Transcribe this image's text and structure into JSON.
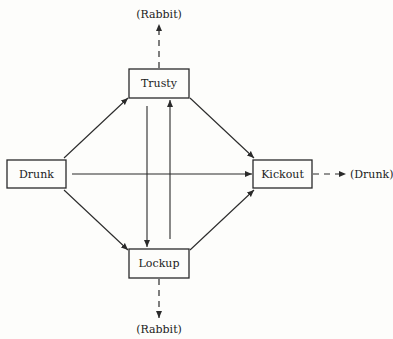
{
  "diagram": {
    "type": "state-transition",
    "nodes": [
      {
        "id": "trusty",
        "label": "Trusty"
      },
      {
        "id": "drunk",
        "label": "Drunk"
      },
      {
        "id": "kickout",
        "label": "Kickout"
      },
      {
        "id": "lockup",
        "label": "Lockup"
      }
    ],
    "external_labels": {
      "top": "(Rabbit)",
      "bottom": "(Rabbit)",
      "right": "(Drunk)"
    },
    "edges": [
      {
        "from": "drunk",
        "to": "trusty",
        "style": "solid"
      },
      {
        "from": "drunk",
        "to": "kickout",
        "style": "solid"
      },
      {
        "from": "drunk",
        "to": "lockup",
        "style": "solid"
      },
      {
        "from": "trusty",
        "to": "kickout",
        "style": "solid"
      },
      {
        "from": "trusty",
        "to": "lockup",
        "style": "solid"
      },
      {
        "from": "lockup",
        "to": "trusty",
        "style": "solid"
      },
      {
        "from": "lockup",
        "to": "kickout",
        "style": "solid"
      },
      {
        "from": "trusty",
        "to": "(Rabbit)",
        "style": "dashed"
      },
      {
        "from": "lockup",
        "to": "(Rabbit)",
        "style": "dashed"
      },
      {
        "from": "kickout",
        "to": "(Drunk)",
        "style": "dashed"
      }
    ]
  }
}
